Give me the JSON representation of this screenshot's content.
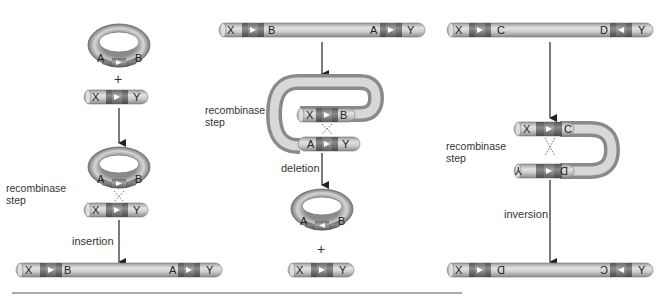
{
  "diagram": {
    "panels": [
      {
        "id": "insertion",
        "start_circle": {
          "labels": [
            "A",
            "B"
          ]
        },
        "plus": "+",
        "start_linear": {
          "labels": [
            "X",
            "Y"
          ]
        },
        "step_label": "recombinase step",
        "arrow_label": "insertion",
        "result_linear": {
          "labels": [
            "X",
            "B",
            "A",
            "Y"
          ]
        }
      },
      {
        "id": "deletion",
        "start_linear": {
          "labels": [
            "X",
            "B",
            "A",
            "Y"
          ]
        },
        "step_label": "recombinase step",
        "loop_labels": [
          "X",
          "B",
          "A",
          "Y"
        ],
        "arrow_label": "deletion",
        "result_circle": {
          "labels": [
            "A",
            "B"
          ]
        },
        "plus": "+",
        "result_linear": {
          "labels": [
            "X",
            "Y"
          ]
        }
      },
      {
        "id": "inversion",
        "start_linear": {
          "labels": [
            "X",
            "C",
            "D",
            "Y"
          ]
        },
        "step_label": "recombinase step",
        "loop_labels": [
          "X",
          "C",
          "D",
          "Y"
        ],
        "arrow_label": "inversion",
        "result_linear": {
          "labels": [
            "X",
            "D",
            "C",
            "Y"
          ],
          "inverted_labels": [
            "D",
            "C"
          ]
        }
      }
    ],
    "text": {
      "recombinase": "recombinase",
      "step": "step",
      "step_flipped": "step",
      "insertion": "insertion",
      "deletion": "deletion",
      "inversion": "inversion",
      "plus": "+"
    },
    "colors": {
      "tube": "#c8c8c8",
      "tube_dark": "#8c8c8c",
      "site": "#6e6e6e",
      "site_dark": "#555555",
      "arrow": "#222222",
      "rule": "#555555"
    }
  }
}
